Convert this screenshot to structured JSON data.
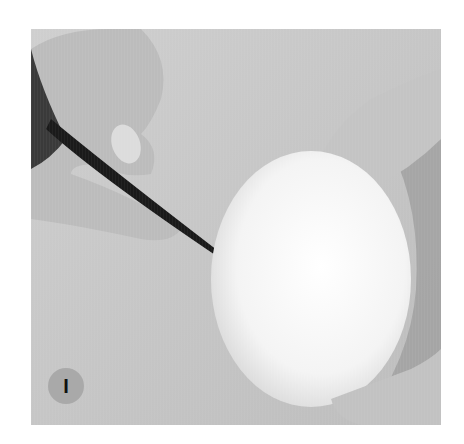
{
  "photo": {
    "description": "Grayscale photo: hand holding a felting needle poking a white wool egg-shaped form held by another hand",
    "colors": {
      "background_fabric": "#c9c9c9",
      "wool_form": "#f8f8f8",
      "skin": "#bdbdbd",
      "needle": "#1a1a1a",
      "badge": "#a9a9a9"
    }
  },
  "step_label": "I"
}
